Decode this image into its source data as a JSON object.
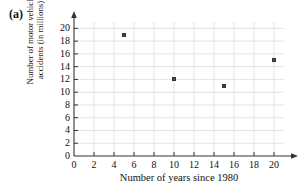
{
  "figure": {
    "part_label": "(a)"
  },
  "chart_data": {
    "type": "scatter",
    "title": "",
    "xlabel": "Number of years since 1980",
    "ylabel_line1": "Number of motor vehicle",
    "ylabel_line2": "accidents (in millions)",
    "ylabel": "Number of motor vehicle accidents (in millions)",
    "xlim": [
      0,
      21
    ],
    "ylim": [
      0,
      21
    ],
    "x_ticks": [
      0,
      2,
      4,
      6,
      8,
      10,
      12,
      14,
      16,
      18,
      20
    ],
    "y_ticks": [
      0,
      2,
      4,
      6,
      8,
      10,
      12,
      14,
      16,
      18,
      20
    ],
    "x_tick_labels": [
      "0",
      "2",
      "4",
      "6",
      "8",
      "10",
      "12",
      "14",
      "16",
      "18",
      "20"
    ],
    "y_tick_labels": [
      "0",
      "2",
      "4",
      "6",
      "8",
      "10",
      "12",
      "14",
      "16",
      "18",
      "20"
    ],
    "grid": true,
    "grid_color": "#dcdcdc",
    "legend": false,
    "marker_color": "#4a4a4a",
    "axis_color": "#333333",
    "points": [
      {
        "x": 5,
        "y": 19
      },
      {
        "x": 10,
        "y": 12
      },
      {
        "x": 15,
        "y": 11
      },
      {
        "x": 20,
        "y": 15
      }
    ],
    "x": [
      5,
      10,
      15,
      20
    ],
    "values": [
      19,
      12,
      11,
      15
    ]
  }
}
